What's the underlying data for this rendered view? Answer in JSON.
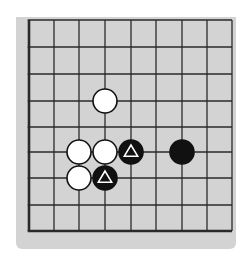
{
  "diagram": {
    "type": "go-board-corner",
    "colors": {
      "board": "#d3d3d3",
      "line": "#2a2a2a",
      "black_stone": "#111111",
      "white_stone": "#ffffff",
      "marker_on_black": "#ffffff"
    },
    "grid": {
      "x_lines": [
        29,
        54,
        79,
        105,
        131,
        156,
        182,
        207,
        232
      ],
      "y_lines": [
        20,
        47,
        74,
        101,
        127,
        152,
        178,
        205,
        231
      ],
      "thick_edges": [
        "left",
        "bottom"
      ]
    },
    "stone_radius": 12,
    "stones": [
      {
        "color": "white",
        "col": 3,
        "row": 3,
        "marker": null
      },
      {
        "color": "white",
        "col": 2,
        "row": 5,
        "marker": null
      },
      {
        "color": "white",
        "col": 3,
        "row": 5,
        "marker": null
      },
      {
        "color": "black",
        "col": 4,
        "row": 5,
        "marker": "triangle"
      },
      {
        "color": "black",
        "col": 6,
        "row": 5,
        "marker": null
      },
      {
        "color": "white",
        "col": 2,
        "row": 6,
        "marker": null
      },
      {
        "color": "black",
        "col": 3,
        "row": 6,
        "marker": "triangle"
      }
    ]
  }
}
